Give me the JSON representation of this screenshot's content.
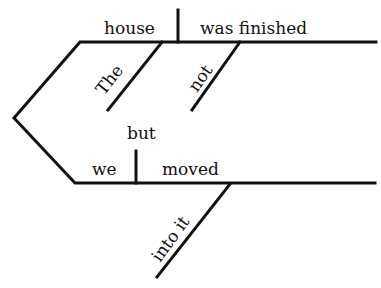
{
  "diagram": {
    "type": "Reed-Kellogg sentence diagram",
    "sentence_parts": {
      "clause1": {
        "subject": "house",
        "predicate": "was finished",
        "modifiers": [
          "The",
          "not"
        ]
      },
      "conjunction": "but",
      "clause2": {
        "subject": "we",
        "predicate": "moved",
        "modifiers": [
          "into it"
        ]
      }
    },
    "line_color": "#111111",
    "background": "#ffffff"
  }
}
